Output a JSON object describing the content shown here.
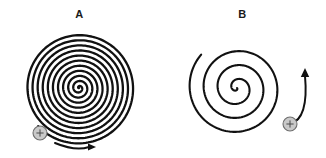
{
  "figure": {
    "width": 326,
    "height": 158,
    "background_color": "#ffffff",
    "stroke_color": "#111111",
    "marker_fill_color": "#c9c9c9",
    "marker_stroke_color": "#6e6e6e",
    "marker_glyph": "+"
  },
  "panels": [
    {
      "label": "A",
      "name": "spiral-a",
      "description": "Tightly wound Archimedean spiral",
      "center_x": 79,
      "center_y": 88,
      "outer_radius": 56,
      "turns": 11,
      "winding": "clockwise-inward",
      "stroke_width": 2.3,
      "marker": {
        "label": "+",
        "x": 40,
        "y": 133,
        "radius": 7
      },
      "arrow": {
        "kind": "straight-curved",
        "label": "direction-arrow",
        "start_x": 55,
        "start_y": 143,
        "end_x": 96,
        "end_y": 147,
        "points_toward": "right"
      }
    },
    {
      "label": "B",
      "name": "spiral-b",
      "description": "Loosely wound Archimedean spiral",
      "center_x": 237,
      "center_y": 88,
      "outer_radius": 49,
      "turns": 3.5,
      "winding": "clockwise-inward",
      "stroke_width": 2.1,
      "marker": {
        "label": "+",
        "x": 290,
        "y": 124,
        "radius": 7
      },
      "arrow": {
        "kind": "curved",
        "label": "direction-arrow",
        "start_x": 290,
        "start_y": 124,
        "end_x": 305,
        "end_y": 68,
        "points_toward": "up"
      }
    }
  ]
}
